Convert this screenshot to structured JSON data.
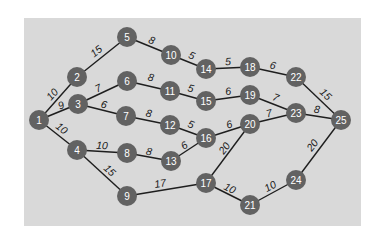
{
  "diagram": {
    "type": "weighted-undirected-graph",
    "colors": {
      "panel": "#d9d9d9",
      "node": "#626262",
      "node_text": "#ffffff",
      "edge": "#1e1e1e",
      "weight_text": "#1a1a1a"
    },
    "nodes": [
      {
        "id": "1",
        "label": "1",
        "x": 39,
        "y": 120
      },
      {
        "id": "2",
        "label": "2",
        "x": 77,
        "y": 77
      },
      {
        "id": "3",
        "label": "3",
        "x": 78,
        "y": 104
      },
      {
        "id": "4",
        "label": "4",
        "x": 77,
        "y": 150
      },
      {
        "id": "5",
        "label": "5",
        "x": 127,
        "y": 37
      },
      {
        "id": "6",
        "label": "6",
        "x": 127,
        "y": 81
      },
      {
        "id": "7",
        "label": "7",
        "x": 126,
        "y": 116
      },
      {
        "id": "8",
        "label": "8",
        "x": 127,
        "y": 153
      },
      {
        "id": "9",
        "label": "9",
        "x": 127,
        "y": 196
      },
      {
        "id": "10",
        "label": "10",
        "x": 171,
        "y": 55
      },
      {
        "id": "11",
        "label": "11",
        "x": 170,
        "y": 91
      },
      {
        "id": "12",
        "label": "12",
        "x": 170,
        "y": 125
      },
      {
        "id": "13",
        "label": "13",
        "x": 171,
        "y": 161
      },
      {
        "id": "14",
        "label": "14",
        "x": 206,
        "y": 69
      },
      {
        "id": "15",
        "label": "15",
        "x": 206,
        "y": 101
      },
      {
        "id": "16",
        "label": "16",
        "x": 206,
        "y": 138
      },
      {
        "id": "17",
        "label": "17",
        "x": 206,
        "y": 183
      },
      {
        "id": "18",
        "label": "18",
        "x": 250,
        "y": 67
      },
      {
        "id": "19",
        "label": "19",
        "x": 250,
        "y": 95
      },
      {
        "id": "20",
        "label": "20",
        "x": 250,
        "y": 124
      },
      {
        "id": "21",
        "label": "21",
        "x": 250,
        "y": 205
      },
      {
        "id": "22",
        "label": "22",
        "x": 296,
        "y": 77
      },
      {
        "id": "23",
        "label": "23",
        "x": 296,
        "y": 113
      },
      {
        "id": "24",
        "label": "24",
        "x": 296,
        "y": 180
      },
      {
        "id": "25",
        "label": "25",
        "x": 341,
        "y": 120
      }
    ],
    "edges": [
      {
        "from": "1",
        "to": "2",
        "weight": "10",
        "lx": 52,
        "ly": 94
      },
      {
        "from": "1",
        "to": "3",
        "weight": "9",
        "lx": 61,
        "ly": 105
      },
      {
        "from": "1",
        "to": "4",
        "weight": "10",
        "lx": 62,
        "ly": 128
      },
      {
        "from": "2",
        "to": "5",
        "weight": "15",
        "lx": 96,
        "ly": 51
      },
      {
        "from": "3",
        "to": "6",
        "weight": "7",
        "lx": 98,
        "ly": 88
      },
      {
        "from": "3",
        "to": "7",
        "weight": "6",
        "lx": 104,
        "ly": 104
      },
      {
        "from": "4",
        "to": "8",
        "weight": "10",
        "lx": 102,
        "ly": 145
      },
      {
        "from": "4",
        "to": "9",
        "weight": "15",
        "lx": 110,
        "ly": 170
      },
      {
        "from": "5",
        "to": "10",
        "weight": "8",
        "lx": 152,
        "ly": 40
      },
      {
        "from": "6",
        "to": "11",
        "weight": "8",
        "lx": 151,
        "ly": 77
      },
      {
        "from": "7",
        "to": "12",
        "weight": "8",
        "lx": 149,
        "ly": 113
      },
      {
        "from": "8",
        "to": "13",
        "weight": "8",
        "lx": 149,
        "ly": 151
      },
      {
        "from": "9",
        "to": "17",
        "weight": "17",
        "lx": 160,
        "ly": 183
      },
      {
        "from": "10",
        "to": "14",
        "weight": "5",
        "lx": 192,
        "ly": 55
      },
      {
        "from": "11",
        "to": "15",
        "weight": "5",
        "lx": 191,
        "ly": 88
      },
      {
        "from": "12",
        "to": "16",
        "weight": "5",
        "lx": 191,
        "ly": 124
      },
      {
        "from": "13",
        "to": "16",
        "weight": "6",
        "lx": 184,
        "ly": 145
      },
      {
        "from": "14",
        "to": "18",
        "weight": "5",
        "lx": 228,
        "ly": 61
      },
      {
        "from": "15",
        "to": "19",
        "weight": "6",
        "lx": 228,
        "ly": 91
      },
      {
        "from": "16",
        "to": "20",
        "weight": "6",
        "lx": 229,
        "ly": 124
      },
      {
        "from": "17",
        "to": "20",
        "weight": "20",
        "lx": 224,
        "ly": 148
      },
      {
        "from": "17",
        "to": "21",
        "weight": "10",
        "lx": 230,
        "ly": 188
      },
      {
        "from": "18",
        "to": "22",
        "weight": "6",
        "lx": 273,
        "ly": 65
      },
      {
        "from": "19",
        "to": "23",
        "weight": "7",
        "lx": 276,
        "ly": 97
      },
      {
        "from": "20",
        "to": "23",
        "weight": "7",
        "lx": 269,
        "ly": 113
      },
      {
        "from": "22",
        "to": "25",
        "weight": "15",
        "lx": 326,
        "ly": 94
      },
      {
        "from": "23",
        "to": "25",
        "weight": "8",
        "lx": 317,
        "ly": 109
      },
      {
        "from": "21",
        "to": "24",
        "weight": "10",
        "lx": 270,
        "ly": 186
      },
      {
        "from": "24",
        "to": "25",
        "weight": "20",
        "lx": 312,
        "ly": 145
      }
    ]
  }
}
